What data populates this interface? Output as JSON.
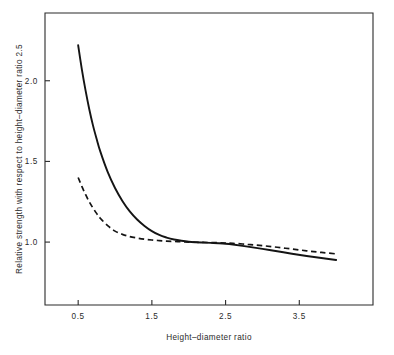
{
  "chart_data": {
    "type": "line",
    "title": "",
    "subtitle": "",
    "xlabel": "Height–diameter ratio",
    "ylabel": "Relative strength with respect to height–diameter ratio 2.5",
    "xlim": [
      0.05,
      4.5
    ],
    "ylim": [
      0.61,
      2.42
    ],
    "xticks": [
      0.5,
      1.5,
      2.5,
      3.5
    ],
    "xticklabels": [
      "0.5",
      "1.5",
      "2.5",
      "3.5"
    ],
    "yticks": [
      1.0,
      1.5,
      2.0
    ],
    "yticklabels": [
      "1.0",
      "1.5",
      "2.0"
    ],
    "grid": false,
    "legend": "none",
    "frame": "box",
    "series": [
      {
        "name": "solid-curve",
        "style": "solid",
        "color": "#141414",
        "x": [
          0.5,
          0.55,
          0.6,
          0.65,
          0.7,
          0.75,
          0.8,
          0.9,
          1.0,
          1.1,
          1.2,
          1.3,
          1.4,
          1.5,
          1.6,
          1.7,
          1.8,
          1.9,
          2.0,
          2.1,
          2.2,
          2.3,
          2.4,
          2.5,
          2.6,
          2.8,
          3.0,
          3.2,
          3.4,
          3.6,
          3.8,
          4.0
        ],
        "y": [
          2.22,
          2.07,
          1.94,
          1.825,
          1.725,
          1.64,
          1.562,
          1.435,
          1.335,
          1.255,
          1.19,
          1.14,
          1.1,
          1.068,
          1.044,
          1.028,
          1.016,
          1.008,
          1.002,
          0.999,
          0.997,
          0.995,
          0.993,
          0.99,
          0.985,
          0.972,
          0.958,
          0.943,
          0.928,
          0.914,
          0.901,
          0.889
        ]
      },
      {
        "name": "dashed-curve",
        "style": "dashed",
        "color": "#141414",
        "x": [
          0.5,
          0.55,
          0.6,
          0.65,
          0.7,
          0.75,
          0.8,
          0.9,
          1.0,
          1.1,
          1.2,
          1.3,
          1.4,
          1.5,
          1.6,
          1.7,
          1.8,
          1.9,
          2.0,
          2.1,
          2.2,
          2.3,
          2.4,
          2.5,
          2.6,
          2.8,
          3.0,
          3.2,
          3.4,
          3.6,
          3.8,
          4.0
        ],
        "y": [
          1.4,
          1.345,
          1.295,
          1.25,
          1.212,
          1.178,
          1.148,
          1.102,
          1.068,
          1.048,
          1.034,
          1.025,
          1.018,
          1.013,
          1.009,
          1.006,
          1.004,
          1.002,
          1.0,
          0.999,
          0.998,
          0.997,
          0.996,
          0.994,
          0.992,
          0.986,
          0.978,
          0.968,
          0.957,
          0.946,
          0.936,
          0.927
        ]
      }
    ]
  },
  "axes": {
    "x_title": "Height–diameter ratio",
    "y_title": "Relative strength with respect to height–diameter ratio 2.5",
    "x_tick_labels": [
      "0.5",
      "1.5",
      "2.5",
      "3.5"
    ],
    "y_tick_labels": [
      "1.0",
      "1.5",
      "2.0"
    ]
  },
  "colors": {
    "ink": "#2b2b2b",
    "curve": "#141414",
    "background": "#ffffff"
  }
}
